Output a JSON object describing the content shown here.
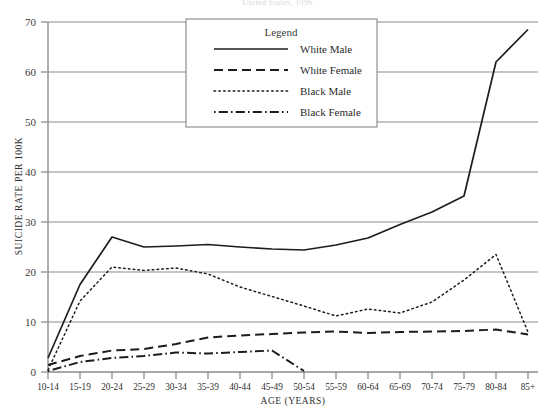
{
  "chart_data": {
    "type": "line",
    "title": "United States, 1996",
    "xlabel": "AGE (YEARS)",
    "ylabel": "SUICIDE RATE PER 100K",
    "categories": [
      "10-14",
      "15-19",
      "20-24",
      "25-29",
      "30-34",
      "35-39",
      "40-44",
      "45-49",
      "50-54",
      "55-59",
      "60-64",
      "65-69",
      "70-74",
      "75-79",
      "80-84",
      "85+"
    ],
    "ylim": [
      0,
      70
    ],
    "ytick_labels": [
      "0",
      "10",
      "20",
      "30",
      "40",
      "50",
      "60",
      "70"
    ],
    "ytick_values": [
      0,
      10,
      20,
      30,
      40,
      50,
      60,
      70
    ],
    "grid": "horizontal",
    "legend_position": "top-center",
    "legend_title": "Legend",
    "series": [
      {
        "name": "White Male",
        "style": "solid",
        "values": [
          2.8,
          17.5,
          27.0,
          25.0,
          25.2,
          25.5,
          25.0,
          24.6,
          24.4,
          25.4,
          26.8,
          29.5,
          32.0,
          35.2,
          62.0,
          68.5
        ]
      },
      {
        "name": "White Female",
        "style": "dashed",
        "values": [
          1.4,
          3.2,
          4.3,
          4.6,
          5.6,
          6.9,
          7.3,
          7.6,
          7.9,
          8.1,
          7.8,
          8.0,
          8.1,
          8.2,
          8.5,
          7.5
        ]
      },
      {
        "name": "Black Male",
        "style": "dotted",
        "values": [
          0.4,
          14.2,
          21.0,
          20.3,
          20.8,
          19.6,
          17.0,
          15.1,
          13.2,
          11.2,
          12.6,
          11.8,
          14.0,
          18.4,
          23.5,
          8.0
        ]
      },
      {
        "name": "Black Female",
        "style": "dash-dot",
        "values": [
          0.2,
          2.0,
          2.8,
          3.2,
          3.9,
          3.7,
          4.0,
          4.3,
          0.2,
          null,
          null,
          null,
          null,
          null,
          null,
          null
        ]
      }
    ]
  }
}
